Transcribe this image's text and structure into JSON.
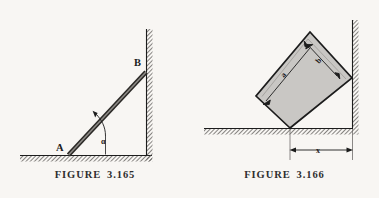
{
  "figures": [
    {
      "id": "figure-3-165",
      "caption": "FIGURE  3.165",
      "labels": {
        "point_a": "A",
        "point_b": "B",
        "angle": "α"
      },
      "description": "rod leaning from floor point A to wall point B making angle alpha with the floor"
    },
    {
      "id": "figure-3-166",
      "caption": "FIGURE  3.166",
      "labels": {
        "side_a": "a",
        "side_b": "b",
        "distance_x": "x"
      },
      "description": "tilted rectangular block of sides a and b resting in a corner, distance x from contact point to wall"
    }
  ],
  "colors": {
    "page_background": "#f8f6f3",
    "ink": "#1c1c1c",
    "hatch": "#6e6b68",
    "block_fill": "#c9c7c4",
    "rod_fill": "#6b6865"
  }
}
